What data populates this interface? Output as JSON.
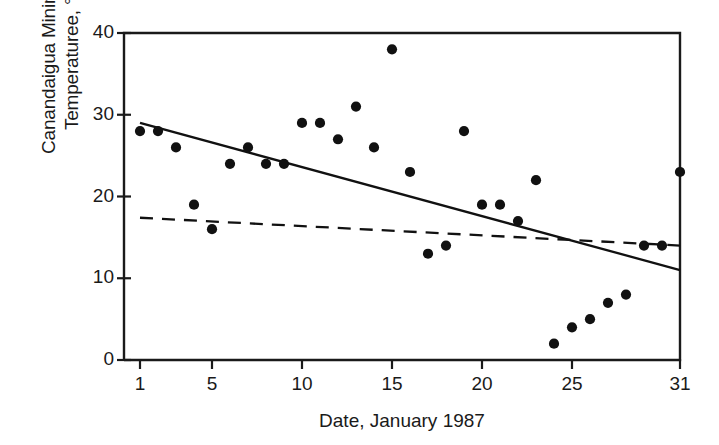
{
  "chart_data": {
    "type": "scatter",
    "title": "",
    "subtitle": "",
    "xlabel": "Date, January 1987",
    "ylabel": "Canandaigua Minimum\nTemperaturee, °F",
    "xlim": [
      0.3,
      31.7
    ],
    "ylim": [
      0,
      40
    ],
    "xticks": [
      1,
      5,
      10,
      15,
      20,
      25,
      31
    ],
    "xticklabels": [
      "1",
      "5",
      "10",
      "15",
      "20",
      "25",
      "31"
    ],
    "yticks": [
      0,
      10,
      20,
      30,
      40
    ],
    "yticklabels": [
      "0",
      "10",
      "20",
      "30",
      "40"
    ],
    "grid": false,
    "legend": null,
    "marker": "filled-circle",
    "marker_color": "#111111",
    "axis_color": "#1a1a1a",
    "x": [
      1,
      2,
      3,
      4,
      5,
      6,
      7,
      8,
      9,
      10,
      11,
      12,
      13,
      14,
      15,
      16,
      17,
      18,
      19,
      20,
      21,
      22,
      23,
      24,
      25,
      26,
      27,
      28,
      29,
      30,
      31
    ],
    "y": [
      28,
      28,
      26,
      19,
      16,
      24,
      26,
      24,
      24,
      29,
      29,
      27,
      31,
      26,
      38,
      23,
      13,
      14,
      28,
      19,
      19,
      17,
      22,
      2,
      4,
      5,
      7,
      8,
      14,
      14,
      23
    ],
    "points": [
      {
        "x": 1,
        "y": 28
      },
      {
        "x": 2,
        "y": 28
      },
      {
        "x": 3,
        "y": 26
      },
      {
        "x": 4,
        "y": 19
      },
      {
        "x": 5,
        "y": 16
      },
      {
        "x": 6,
        "y": 24
      },
      {
        "x": 7,
        "y": 26
      },
      {
        "x": 8,
        "y": 24
      },
      {
        "x": 9,
        "y": 24
      },
      {
        "x": 10,
        "y": 29
      },
      {
        "x": 11,
        "y": 29
      },
      {
        "x": 12,
        "y": 27
      },
      {
        "x": 13,
        "y": 31
      },
      {
        "x": 14,
        "y": 26
      },
      {
        "x": 15,
        "y": 38
      },
      {
        "x": 16,
        "y": 23
      },
      {
        "x": 17,
        "y": 13
      },
      {
        "x": 18,
        "y": 14
      },
      {
        "x": 19,
        "y": 28
      },
      {
        "x": 20,
        "y": 19
      },
      {
        "x": 21,
        "y": 19
      },
      {
        "x": 22,
        "y": 17
      },
      {
        "x": 23,
        "y": 22
      },
      {
        "x": 24,
        "y": 2
      },
      {
        "x": 25,
        "y": 4
      },
      {
        "x": 26,
        "y": 5
      },
      {
        "x": 27,
        "y": 7
      },
      {
        "x": 28,
        "y": 8
      },
      {
        "x": 29,
        "y": 14
      },
      {
        "x": 30,
        "y": 14
      },
      {
        "x": 31,
        "y": 23
      }
    ],
    "lines": [
      {
        "name": "solid-regression-line",
        "style": "solid",
        "color": "#111111",
        "x0": 1,
        "y0": 29.0,
        "x1": 31,
        "y1": 11.0
      },
      {
        "name": "dashed-regression-line",
        "style": "dashed",
        "color": "#111111",
        "x0": 1,
        "y0": 17.4,
        "x1": 31,
        "y1": 14.0
      }
    ]
  }
}
